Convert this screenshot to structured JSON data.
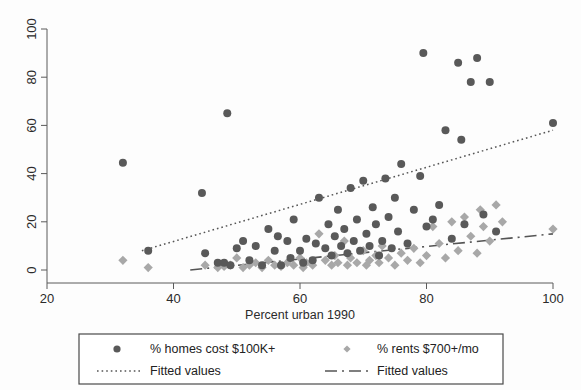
{
  "chart_data": {
    "type": "scatter",
    "title": "",
    "xlabel": "Percent urban 1990",
    "ylabel": "",
    "xlim": [
      20,
      100
    ],
    "ylim": [
      0,
      100
    ],
    "xticks": [
      20,
      40,
      60,
      80,
      100
    ],
    "yticks": [
      0,
      20,
      40,
      60,
      80,
      100
    ],
    "grid": false,
    "legend_position": "below-axis",
    "series": [
      {
        "name": "% homes cost $100K+",
        "marker": "circle",
        "color": "#595959",
        "points": [
          [
            32,
            44.5
          ],
          [
            36,
            8
          ],
          [
            44.5,
            32
          ],
          [
            48.5,
            65
          ],
          [
            45,
            7
          ],
          [
            47,
            3
          ],
          [
            48,
            3
          ],
          [
            49,
            2
          ],
          [
            50,
            9
          ],
          [
            51,
            12
          ],
          [
            52,
            4
          ],
          [
            53,
            10
          ],
          [
            54,
            2
          ],
          [
            55,
            17
          ],
          [
            56,
            8
          ],
          [
            56.5,
            14
          ],
          [
            57,
            2
          ],
          [
            58,
            12
          ],
          [
            58.5,
            5
          ],
          [
            59,
            21
          ],
          [
            60,
            8
          ],
          [
            60.5,
            3
          ],
          [
            61,
            13
          ],
          [
            62,
            4
          ],
          [
            62.5,
            11
          ],
          [
            63,
            30
          ],
          [
            64,
            9
          ],
          [
            64.5,
            19
          ],
          [
            65,
            6
          ],
          [
            65.5,
            14
          ],
          [
            66,
            25
          ],
          [
            66.5,
            10
          ],
          [
            67,
            17
          ],
          [
            67.5,
            7
          ],
          [
            68,
            34
          ],
          [
            68.5,
            12
          ],
          [
            69,
            21
          ],
          [
            69.5,
            8
          ],
          [
            70,
            37
          ],
          [
            70.5,
            15
          ],
          [
            71,
            10
          ],
          [
            71.5,
            26
          ],
          [
            72,
            19
          ],
          [
            72.5,
            6
          ],
          [
            73,
            12
          ],
          [
            73.5,
            38
          ],
          [
            74,
            22
          ],
          [
            74.5,
            9
          ],
          [
            75,
            30
          ],
          [
            75.5,
            16
          ],
          [
            76,
            44
          ],
          [
            77,
            11
          ],
          [
            78,
            25
          ],
          [
            79,
            39
          ],
          [
            79.5,
            90
          ],
          [
            80,
            18
          ],
          [
            81,
            21
          ],
          [
            82,
            27
          ],
          [
            83,
            58
          ],
          [
            84,
            13
          ],
          [
            85,
            86
          ],
          [
            85.5,
            54
          ],
          [
            86,
            19
          ],
          [
            87,
            78
          ],
          [
            88,
            88
          ],
          [
            89,
            23
          ],
          [
            90,
            78
          ],
          [
            91,
            16
          ],
          [
            100,
            61
          ]
        ]
      },
      {
        "name": "% rents $700+/mo",
        "marker": "diamond",
        "color": "#a8a8a8",
        "points": [
          [
            32,
            4
          ],
          [
            36,
            1
          ],
          [
            45,
            2
          ],
          [
            47,
            1
          ],
          [
            48,
            1.5
          ],
          [
            49,
            2
          ],
          [
            50,
            5
          ],
          [
            51,
            1
          ],
          [
            52,
            2
          ],
          [
            53,
            3
          ],
          [
            54,
            1
          ],
          [
            55,
            4
          ],
          [
            56,
            2
          ],
          [
            57,
            1.5
          ],
          [
            58,
            3
          ],
          [
            59,
            2
          ],
          [
            60,
            5
          ],
          [
            60.5,
            1
          ],
          [
            61,
            3
          ],
          [
            62,
            2
          ],
          [
            63,
            15
          ],
          [
            64,
            4
          ],
          [
            65,
            2
          ],
          [
            65.5,
            6
          ],
          [
            66,
            3
          ],
          [
            67,
            12
          ],
          [
            67.5,
            2
          ],
          [
            68,
            5
          ],
          [
            69,
            3
          ],
          [
            70,
            8
          ],
          [
            70.5,
            2
          ],
          [
            71,
            4
          ],
          [
            72,
            6
          ],
          [
            72.5,
            3
          ],
          [
            73,
            10
          ],
          [
            74,
            5
          ],
          [
            75,
            2
          ],
          [
            76,
            7
          ],
          [
            77,
            4
          ],
          [
            78,
            9
          ],
          [
            79,
            3
          ],
          [
            80,
            6
          ],
          [
            81,
            18
          ],
          [
            82,
            11
          ],
          [
            83,
            5
          ],
          [
            84,
            20
          ],
          [
            85,
            8
          ],
          [
            86,
            22
          ],
          [
            87,
            14
          ],
          [
            88,
            7
          ],
          [
            88.5,
            25
          ],
          [
            89,
            18
          ],
          [
            90,
            12
          ],
          [
            91,
            27
          ],
          [
            92,
            20
          ],
          [
            100,
            17
          ]
        ]
      }
    ],
    "fits": [
      {
        "name": "Fitted values",
        "style": "dotted",
        "for_series": "% homes cost $100K+",
        "x_start": 35,
        "y_start": 8,
        "x_end": 100,
        "y_end": 58
      },
      {
        "name": "Fitted values",
        "style": "dashed",
        "for_series": "% rents $700+/mo",
        "x_start": 35,
        "y_start": -2,
        "x_end": 100,
        "y_end": 15
      }
    ]
  },
  "axes": {
    "x_title": "Percent urban 1990",
    "x_tick_labels": [
      "20",
      "40",
      "60",
      "80",
      "100"
    ],
    "y_tick_labels": [
      "0",
      "20",
      "40",
      "60",
      "80",
      "100"
    ]
  },
  "legend": {
    "entries": [
      {
        "label": "% homes cost $100K+",
        "marker": "circle",
        "color": "#595959"
      },
      {
        "label": "% rents $700+/mo",
        "marker": "diamond",
        "color": "#a8a8a8"
      },
      {
        "label": "Fitted values",
        "marker": "dotted-line",
        "color": "#555555"
      },
      {
        "label": "Fitted values",
        "marker": "dashed-line",
        "color": "#555555"
      }
    ]
  },
  "colors": {
    "circle_marker": "#595959",
    "diamond_marker": "#a8a8a8",
    "axis": "#5a5a5a",
    "background": "#fdfdfd"
  }
}
